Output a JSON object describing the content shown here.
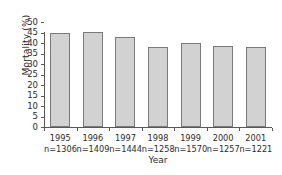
{
  "chart_data": {
    "type": "bar",
    "title": "",
    "xlabel": "Year",
    "ylabel": "Mortality (%)",
    "categories": [
      "1995",
      "1996",
      "1997",
      "1998",
      "1999",
      "2000",
      "2001"
    ],
    "values": [
      44.7,
      45.2,
      43.0,
      38.1,
      40.0,
      38.6,
      37.9
    ],
    "sample_sizes": [
      "n=1306",
      "n=1409",
      "n=1444",
      "n=1258",
      "n=1570",
      "n=1257",
      "n=1221"
    ],
    "ylim": [
      0,
      50
    ],
    "yticks": [
      "0",
      "5",
      "10",
      "15",
      "20",
      "25",
      "30",
      "35",
      "40",
      "45",
      "50"
    ],
    "ytick_values": [
      0,
      5,
      10,
      15,
      20,
      25,
      30,
      35,
      40,
      45,
      50
    ],
    "grid": false,
    "legend": null,
    "bar_fill_color": "#d2d2d2",
    "bar_edge_color": "#7a7a7c",
    "axis_color": "#58585a",
    "text_color": "#2b2b2b",
    "background_color": "#ffffff"
  }
}
